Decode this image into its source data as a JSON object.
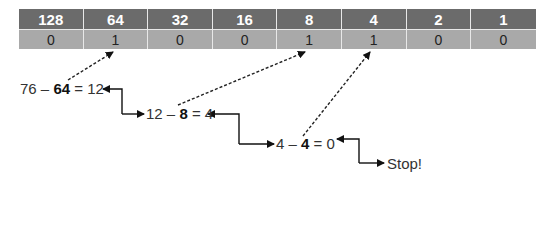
{
  "table": {
    "headers": [
      "128",
      "64",
      "32",
      "16",
      "8",
      "4",
      "2",
      "1"
    ],
    "values": [
      "0",
      "1",
      "0",
      "0",
      "1",
      "1",
      "0",
      "0"
    ]
  },
  "steps": [
    {
      "a": "76",
      "op": " – ",
      "b": "64",
      "eq": " = ",
      "r": "12"
    },
    {
      "a": "12",
      "op": " – ",
      "b": "8",
      "eq": " = ",
      "r": "4"
    },
    {
      "a": "4",
      "op": " – ",
      "b": "4",
      "eq": " = ",
      "r": "0"
    }
  ],
  "stop_label": "Stop!"
}
